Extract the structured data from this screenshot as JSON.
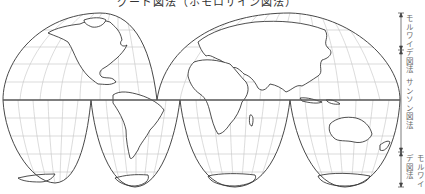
{
  "title": "グード図法（ホモロサイン図法）",
  "projection_labels": {
    "top": "モルワイデ図法",
    "middle": "サンソン図法",
    "bottom": "モルワイデ図法"
  },
  "colors": {
    "outline": "#333333",
    "grid": "#bbbbbb",
    "equator": "#555555",
    "land": "#ffffff"
  },
  "continents": [
    "北アメリカ",
    "南アメリカ",
    "ユーラシア",
    "アフリカ",
    "オーストラリア",
    "南極"
  ]
}
